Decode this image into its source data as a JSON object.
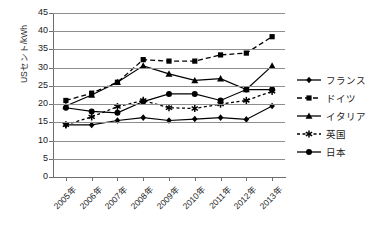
{
  "chart_data": {
    "type": "line",
    "title": "",
    "xlabel": "",
    "ylabel": "USセント/kWh",
    "ylim": [
      0,
      45
    ],
    "yticks": [
      0,
      5,
      10,
      15,
      20,
      25,
      30,
      35,
      40,
      45
    ],
    "grid": true,
    "legend_position": "right",
    "categories": [
      "2005年",
      "2006年",
      "2007年",
      "2008年",
      "2009年",
      "2010年",
      "2011年",
      "2012年",
      "2013年"
    ],
    "series": [
      {
        "name": "フランス",
        "marker": "diamond",
        "line": "solid",
        "color": "#000000",
        "values": [
          14.3,
          14.3,
          15.5,
          16.3,
          15.5,
          15.9,
          16.3,
          15.8,
          19.5
        ]
      },
      {
        "name": "ドイツ",
        "marker": "square",
        "line": "dashed",
        "color": "#000000",
        "values": [
          21.0,
          23.0,
          26.0,
          32.2,
          31.8,
          31.8,
          33.5,
          34.0,
          38.5
        ]
      },
      {
        "name": "イタリア",
        "marker": "triangle",
        "line": "solid",
        "color": "#000000",
        "values": [
          19.5,
          22.5,
          26.0,
          30.5,
          28.3,
          26.5,
          27.0,
          24.0,
          30.5
        ]
      },
      {
        "name": "英国",
        "marker": "asterisk",
        "line": "dotted",
        "color": "#000000",
        "values": [
          14.3,
          16.5,
          19.3,
          21.0,
          19.0,
          18.8,
          20.0,
          21.0,
          23.5
        ]
      },
      {
        "name": "日本",
        "marker": "circle",
        "line": "solid",
        "color": "#000000",
        "values": [
          19.0,
          18.0,
          17.6,
          20.7,
          22.8,
          22.8,
          21.0,
          24.0,
          24.0
        ]
      }
    ]
  },
  "axis": {
    "y_title": "USセント/kWh"
  }
}
